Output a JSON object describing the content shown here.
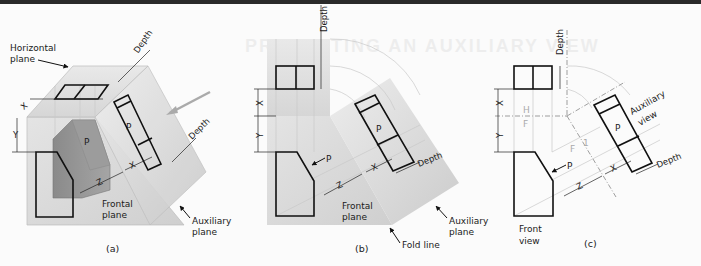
{
  "ghost_title": "PROJECTING AN AUXILIARY VIEW",
  "panel_a": {
    "caption": "(a)",
    "labels": {
      "horizontal_plane": [
        "Horizontal",
        "plane"
      ],
      "frontal_plane": [
        "Frontal",
        "plane"
      ],
      "auxiliary_plane": [
        "Auxiliary",
        "plane"
      ],
      "surface": "P",
      "depth_top": "Depth",
      "depth_aux": "Depth",
      "x": "X",
      "y": "Y",
      "z": "Z"
    }
  },
  "panel_b": {
    "caption": "(b)",
    "labels": {
      "depth_top": "Depth",
      "depth_aux": "Depth",
      "frontal_plane": [
        "Frontal",
        "plane"
      ],
      "auxiliary_plane": [
        "Auxiliary",
        "plane"
      ],
      "fold_line": "Fold line",
      "surface_front": "P",
      "surface_aux": "P",
      "x_left": "X",
      "x_aux": "X",
      "y": "Y",
      "z": "Z"
    }
  },
  "panel_c": {
    "caption": "(c)",
    "labels": {
      "depth_top": "Depth",
      "depth_aux": "Depth",
      "auxiliary_view": [
        "Auxiliary",
        "view"
      ],
      "front_view": [
        "Front",
        "view"
      ],
      "fold_h": "H",
      "fold_f": "F",
      "fold_f2": "F",
      "fold_1": "1",
      "surface_front": "P",
      "surface_aux": "P",
      "x_left": "X",
      "x_aux": "X",
      "y": "Y",
      "z": "Z"
    }
  }
}
